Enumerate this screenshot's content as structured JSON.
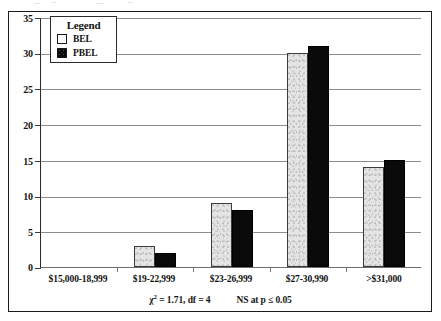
{
  "chart_data": {
    "type": "bar",
    "title": "",
    "subtitle": "",
    "xlabel": "",
    "ylabel": "",
    "ylim": [
      0,
      35
    ],
    "yticks": [
      0,
      5,
      10,
      15,
      20,
      25,
      30,
      35
    ],
    "grid": true,
    "legend_position": "top-left",
    "legend_title": "Legend",
    "categories": [
      "$15,000-18,999",
      "$19-22,999",
      "$23-26,999",
      "$27-30,990",
      ">$31,000"
    ],
    "series": [
      {
        "name": "BEL",
        "values": [
          0,
          3,
          9,
          30,
          14
        ],
        "color": "#e4e4e4"
      },
      {
        "name": "PBEL",
        "values": [
          0,
          2,
          8,
          31,
          15
        ],
        "color": "#0a0a0a"
      }
    ],
    "annotations": {
      "statistic": "χ² = 1.71, df = 4",
      "significance": "NS at p ≤ 0.05"
    }
  },
  "legend": {
    "title": "Legend",
    "items": [
      {
        "label": "BEL",
        "swatch": "open-square-swatch"
      },
      {
        "label": "PBEL",
        "swatch": "filled-square-swatch"
      }
    ]
  },
  "axes": {
    "y_tick_labels": [
      "0",
      "5",
      "10",
      "15",
      "20",
      "25",
      "30",
      "35"
    ],
    "x_tick_labels": [
      "$15,000-18,999",
      "$19-22,999",
      "$23-26,999",
      "$27-30,990",
      ">$31,000"
    ]
  },
  "footnote": {
    "chi_symbol": "χ",
    "chi_exponent": "2",
    "statistic_text": " = 1.71, df = 4",
    "significance_text": "NS at p ≤ 0.05"
  }
}
